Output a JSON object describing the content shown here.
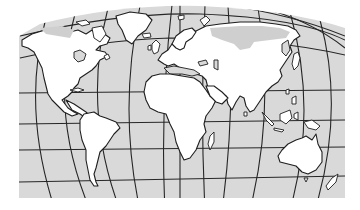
{
  "map": {
    "title": "World map",
    "projection": "curved-meridian world projection with graticule",
    "colors": {
      "ocean": "#d9d9d9",
      "land": "#ffffff",
      "outline": "#1e1e1e",
      "ice": "#cfcfcf"
    },
    "continents": [
      "North America",
      "Greenland",
      "South America",
      "Europe",
      "Africa",
      "Asia",
      "Australia",
      "New Zealand",
      "Madagascar",
      "Japan",
      "Indonesia",
      "British Isles"
    ],
    "graticule": {
      "meridians": 14,
      "parallels": 6
    }
  }
}
